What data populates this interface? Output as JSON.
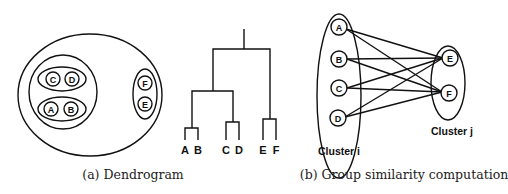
{
  "figure": {
    "panel_a": {
      "caption": "(a) Dendrogram",
      "nested_clusters": {
        "nodes": [
          "C",
          "D",
          "A",
          "B",
          "F",
          "E"
        ]
      },
      "dendrogram": {
        "leaves": [
          "A",
          "B",
          "C",
          "D",
          "E",
          "F"
        ]
      }
    },
    "panel_b": {
      "caption": "(b) Group similarity computation",
      "cluster_i": {
        "label": "Cluster i",
        "nodes": [
          "A",
          "B",
          "C",
          "D"
        ]
      },
      "cluster_j": {
        "label": "Cluster j",
        "nodes": [
          "E",
          "F"
        ]
      }
    }
  }
}
